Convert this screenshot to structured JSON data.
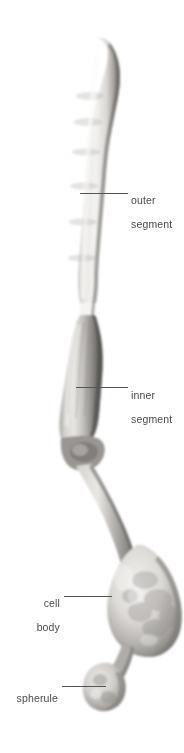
{
  "figure": {
    "background_color": "#ffffff",
    "label_color": "#4a4a4a",
    "leader_color": "#555555",
    "cell_tone_light": "#e8e6e3",
    "cell_tone_mid": "#b9b6b2",
    "cell_tone_dark": "#4a4845"
  },
  "labels": [
    {
      "id": "outer-segment",
      "text": "outer\nsegment",
      "line1": "outer",
      "line2": "segment",
      "side": "right"
    },
    {
      "id": "inner-segment",
      "text": "inner\nsegment",
      "line1": "inner",
      "line2": "segment",
      "side": "right"
    },
    {
      "id": "cell-body",
      "text": "cell\nbody",
      "line1": "cell",
      "line2": "body",
      "side": "left"
    },
    {
      "id": "spherule",
      "text": "spherule",
      "line1": "spherule",
      "line2": "",
      "side": "left"
    }
  ]
}
